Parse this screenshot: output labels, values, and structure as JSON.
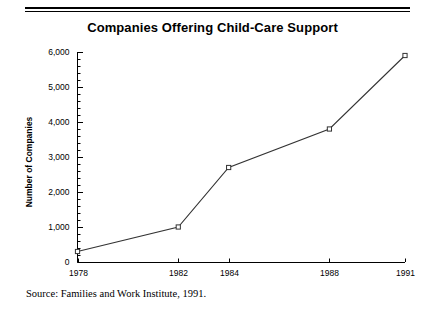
{
  "figure": {
    "title": "Companies Offering Child-Care Support",
    "source_note": "Source: Families and Work Institute, 1991."
  },
  "chart_data": {
    "type": "line",
    "title": "Companies Offering Child-Care Support",
    "xlabel": "",
    "ylabel": "Number of Companies",
    "categories": [
      "1978",
      "1982",
      "1984",
      "1988",
      "1991"
    ],
    "x": [
      1978,
      1982,
      1984,
      1988,
      1991
    ],
    "values": [
      300,
      1000,
      2700,
      3800,
      5900
    ],
    "series": [
      {
        "name": "Number of Companies",
        "values": [
          300,
          1000,
          2700,
          3800,
          5900
        ]
      }
    ],
    "xlim": [
      1978,
      1991
    ],
    "ylim": [
      0,
      6000
    ],
    "ytick_labels": [
      "0",
      "1,000",
      "2,000",
      "3,000",
      "4,000",
      "5,000",
      "6,000"
    ],
    "ytick_values": [
      0,
      1000,
      2000,
      3000,
      4000,
      5000,
      6000
    ],
    "xtick_labels": [
      "1978",
      "1982",
      "1984",
      "1988",
      "1991"
    ],
    "minor_tick_interval": 200,
    "grid": false,
    "legend": false,
    "legend_position": "none",
    "marker": "square",
    "line_color": "#333333",
    "marker_color": "#333333",
    "axis_color": "#000000",
    "background_color": "#ffffff"
  }
}
